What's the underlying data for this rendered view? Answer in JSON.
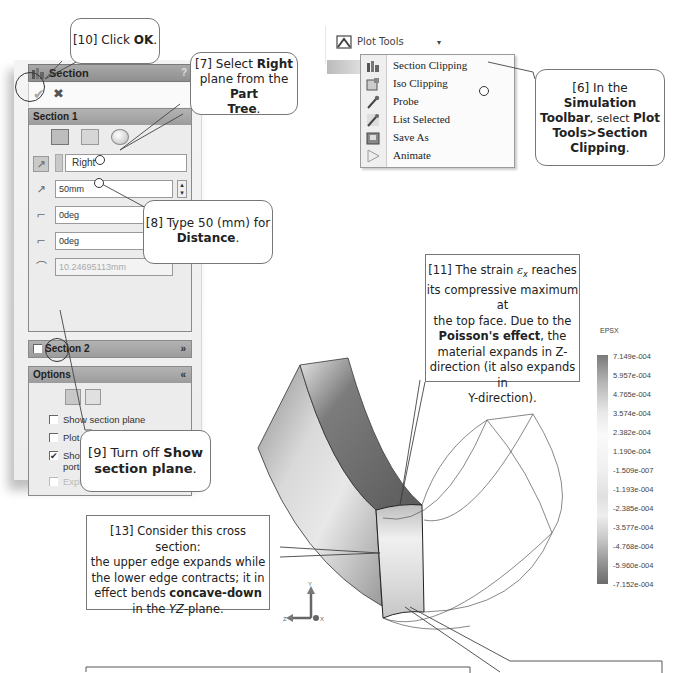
{
  "section_panel": {
    "title": "Section",
    "help": "?",
    "ok_label": "✔",
    "cancel_label": "✖",
    "section1": {
      "header": "Section 1",
      "reference": "Right",
      "distance": "50mm",
      "angle_x": "0deg",
      "angle_y": "0deg",
      "radius": "10.24695113mm"
    },
    "section2": {
      "header": "Section 2",
      "chevron": "»"
    },
    "options": {
      "header": "Options",
      "chevron": "«",
      "checkboxes": [
        {
          "label": "Show section plane",
          "checked": false
        },
        {
          "label": "Plot on section only",
          "checked": false
        },
        {
          "label": "Show contour on the uncut portion of the model",
          "checked": true
        },
        {
          "label": "Explode after clipping",
          "checked": false,
          "disabled": true
        }
      ]
    }
  },
  "toolbar": {
    "plot_tools_label": "Plot Tools",
    "dropdown_arrow": "▾",
    "menu": [
      {
        "label": "Section Clipping",
        "icon": "section-clipping-icon"
      },
      {
        "label": "Iso Clipping",
        "icon": "iso-clipping-icon"
      },
      {
        "label": "Probe",
        "icon": "probe-icon"
      },
      {
        "label": "List Selected",
        "icon": "list-selected-icon"
      },
      {
        "label": "Save As",
        "icon": "save-as-icon"
      },
      {
        "label": "Animate",
        "icon": "animate-icon"
      }
    ]
  },
  "callouts": {
    "c10": {
      "pre": "[10] Click ",
      "bold": "OK",
      "post": "."
    },
    "c7": {
      "l1_pre": "[7] Select ",
      "l1_bold": "Right",
      "l2_pre": "plane from the ",
      "l2_bold": "Part",
      "l3_bold": "Tree",
      "l3_post": "."
    },
    "c6": {
      "l1": "[6] In the",
      "l2_bold": "Simulation",
      "l3_bold": "Toolbar",
      "l3_mid": ", select ",
      "l3_bold2": "Plot",
      "l4_bold": "Tools>Section",
      "l5_bold": "Clipping",
      "l5_post": "."
    },
    "c8": {
      "l1": "[8] Type 50 (mm) for",
      "l2_bold": "Distance",
      "l2_post": "."
    },
    "c9": {
      "l1_pre": "[9] Turn off ",
      "l1_bold": "Show",
      "l2_bold": "section plane",
      "l2_post": "."
    },
    "c11": {
      "l1_pre": "[11] The strain ",
      "l1_sym": "ε",
      "l1_sub": "x",
      "l1_post": " reaches",
      "l2": "its compressive maximum at",
      "l3": "the top face.  Due to the",
      "l4_bold": "Poisson's effect",
      "l4_post": ", the",
      "l5": "material expands in Z-",
      "l6": "direction (it also expands in",
      "l7": "Y-direction)."
    },
    "c13": {
      "l1": "[13] Consider this cross section:",
      "l2": "the upper edge expands while",
      "l3": "the lower edge contracts; it in",
      "l4_pre": "effect bends ",
      "l4_bold": "concave-down",
      "l5_pre": "in the ",
      "l5_it": "YZ",
      "l5_post": "-plane."
    }
  },
  "colorbar": {
    "title": "EPSX",
    "ticks": [
      "7.149e-004",
      "5.957e-004",
      "4.765e-004",
      "3.574e-004",
      "2.382e-004",
      "1.190e-004",
      "-1.509e-007",
      "-1.193e-004",
      "-2.385e-004",
      "-3.577e-004",
      "-4.768e-004",
      "-5.960e-004",
      "-7.152e-004"
    ]
  },
  "triad": {
    "y": "Y",
    "z": "Z",
    "x": "X"
  }
}
